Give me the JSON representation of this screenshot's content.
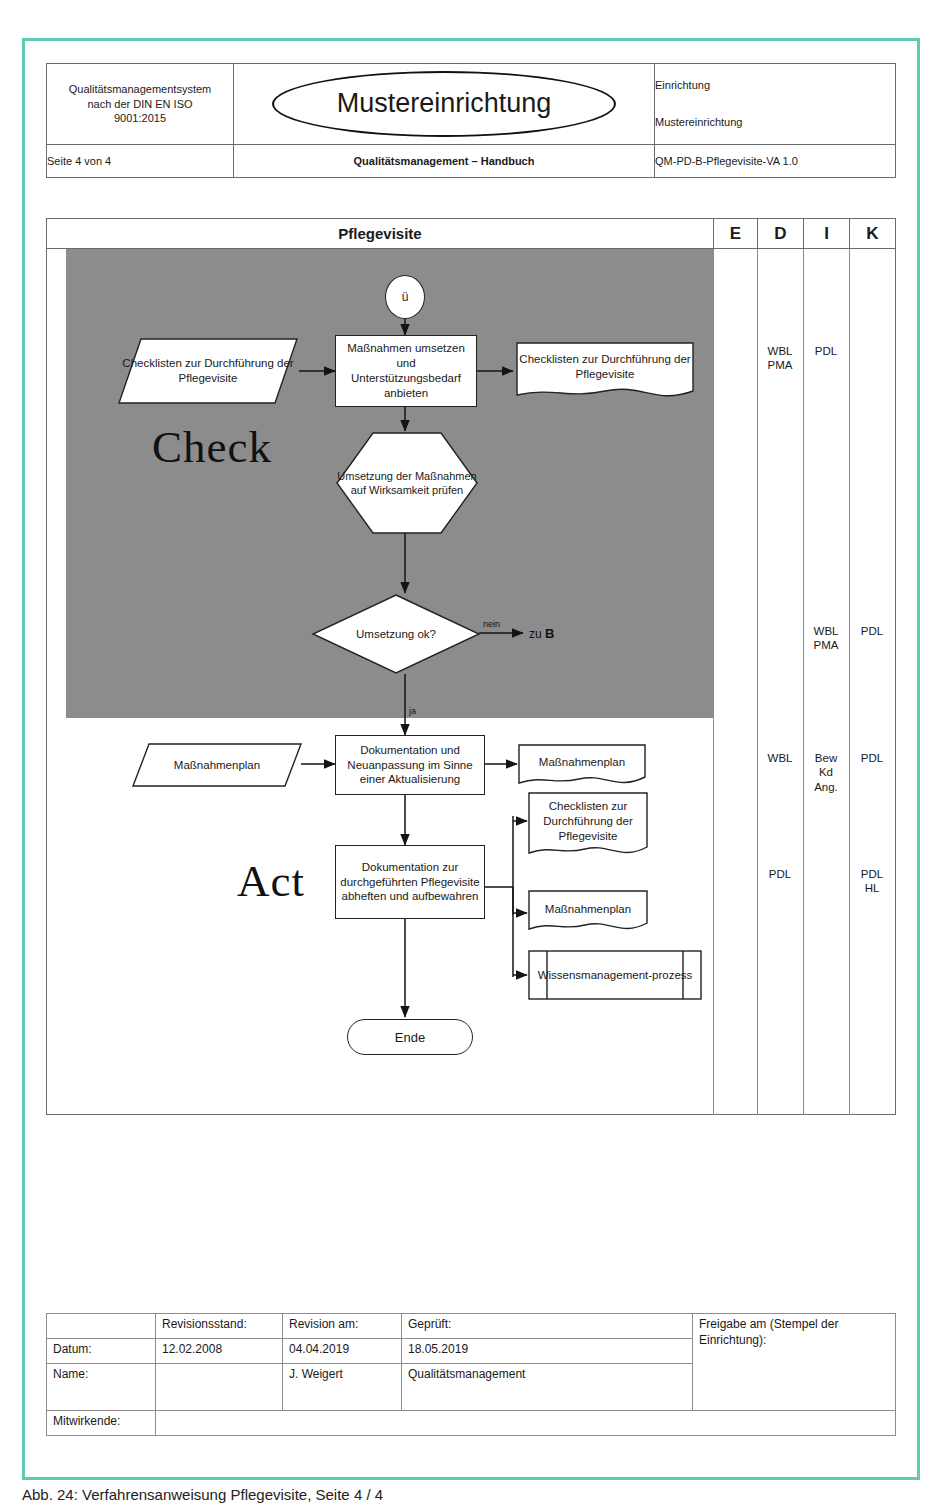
{
  "header": {
    "qms_line1": "Qualitätsmanagementsystem",
    "qms_line2": "nach der DIN EN ISO",
    "qms_line3": "9001:2015",
    "logo_text": "Mustereinrichtung",
    "facility_label": "Einrichtung",
    "facility_name": "Mustereinrichtung",
    "page_info": "Seite 4 von 4",
    "doc_title": "Qualitätsmanagement – Handbuch",
    "doc_code": "QM-PD-B-Pflegevisite-VA 1.0"
  },
  "flow": {
    "title": "Pflegevisite",
    "stage_check": "Check",
    "stage_act": "Act",
    "columns": [
      "E",
      "D",
      "I",
      "K"
    ],
    "connector_top": "ü",
    "end_label": "Ende",
    "nodes": {
      "checklists_in": "Checklisten zur Durchführung der Pflegevisite",
      "massnahmen_umsetzen": "Maßnahmen umsetzen und Unterstützungsbedarf anbieten",
      "checklists_out": "Checklisten zur Durchführung der Pflegevisite",
      "wirksamkeit": "Umsetzung der Maßnahmen auf Wirksamkeit prüfen",
      "umsetzung_ok": "Umsetzung ok?",
      "massnahmenplan_in": "Maßnahmenplan",
      "dokumentation_neu": "Dokumentation und Neuanpassung im Sinne einer Aktualisierung",
      "massnahmenplan_out1": "Maßnahmenplan",
      "dokumentation_ablage": "Dokumentation zur durchgeführten Pflegevisite abheften und aufbewahren",
      "checklisten_out2": "Checklisten zur Durchführung der Pflegevisite",
      "massnahmenplan_out2": "Maßnahmenplan",
      "wissensmanagement": "Wissensmanagement-prozess"
    },
    "edges": {
      "nein": "nein",
      "zu_b_prefix": "zu ",
      "zu_b_target": "B",
      "ja": "ja"
    },
    "responsibilities": [
      {
        "row": "massnahmen",
        "E": "",
        "D": "WBL\nPMA",
        "I": "PDL",
        "K": ""
      },
      {
        "row": "umsetzung_ok",
        "E": "",
        "D": "",
        "I": "WBL\nPMA",
        "K": "PDL"
      },
      {
        "row": "dokumentation_neu",
        "E": "",
        "D": "WBL",
        "I": "Bew\nKd\nAng.",
        "K": "PDL"
      },
      {
        "row": "dokumentation_ablage",
        "E": "",
        "D": "PDL",
        "I": "",
        "K": "PDL\nHL"
      }
    ],
    "responsibility_cells": {
      "d1": "WBL\nPMA",
      "i1": "PDL",
      "i2": "WBL\nPMA",
      "k2": "PDL",
      "d3": "WBL",
      "i3": "Bew\nKd\nAng.",
      "k3": "PDL",
      "d4": "PDL",
      "k4": "PDL\nHL"
    }
  },
  "footer": {
    "headers": [
      "",
      "Revisionsstand:",
      "Revision am:",
      "Geprüft:",
      "Freigabe am (Stempel der Einrichtung):"
    ],
    "rows": [
      {
        "label": "Datum:",
        "revisionsstand": "12.02.2008",
        "revision_am": "04.04.2019",
        "geprueft": "18.05.2019"
      },
      {
        "label": "Name:",
        "revisionsstand": "",
        "revision_am": "J. Weigert",
        "geprueft": "Qualitätsmanagement"
      },
      {
        "label": "Mitwirkende:",
        "revisionsstand": "",
        "revision_am": "",
        "geprueft": ""
      }
    ]
  },
  "caption": "Abb. 24: Verfahrensanweisung Pflegevisite, Seite 4 / 4",
  "colors": {
    "page_border": "#62c9b2",
    "grey_band": "#8c8c8c",
    "line": "#222222"
  }
}
